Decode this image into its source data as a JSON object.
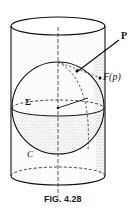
{
  "figure": {
    "caption": "FIG. 4.28",
    "labels": {
      "point": "P",
      "image": "F(p)",
      "sphere": "Σ",
      "cylinder": "C"
    }
  },
  "colors": {
    "ink": "#111111",
    "stipple": "#9a9a9a",
    "background": "#ffffff"
  }
}
